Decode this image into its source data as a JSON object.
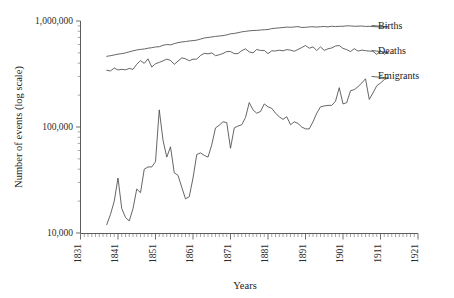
{
  "chart_data": {
    "type": "line",
    "title": "",
    "xlabel": "Years",
    "ylabel": "Number of events (log scale)",
    "yscale": "log",
    "ylim": [
      10000,
      1000000
    ],
    "xlim": [
      1831,
      1921
    ],
    "grid": false,
    "legend_position": "right-inline-labels",
    "ytick_labels": [
      "1,000,000",
      "100,000",
      "10,000"
    ],
    "ytick_values": [
      1000000,
      100000,
      10000
    ],
    "xtick_labels": [
      "1831",
      "1841",
      "1851",
      "1861",
      "1871",
      "1881",
      "1891",
      "1901",
      "1911",
      "1921"
    ],
    "xtick_values": [
      1831,
      1841,
      1851,
      1861,
      1871,
      1881,
      1891,
      1901,
      1911,
      1921
    ],
    "series": [
      {
        "name": "Births",
        "label": "Births",
        "color": "#4a4a4a",
        "x": [
          1838,
          1839,
          1840,
          1841,
          1842,
          1843,
          1844,
          1845,
          1846,
          1847,
          1848,
          1849,
          1850,
          1851,
          1852,
          1853,
          1854,
          1855,
          1856,
          1857,
          1858,
          1859,
          1860,
          1861,
          1862,
          1863,
          1864,
          1865,
          1866,
          1867,
          1868,
          1869,
          1870,
          1871,
          1872,
          1873,
          1874,
          1875,
          1876,
          1877,
          1878,
          1879,
          1880,
          1881,
          1882,
          1883,
          1884,
          1885,
          1886,
          1887,
          1888,
          1889,
          1890,
          1891,
          1892,
          1893,
          1894,
          1895,
          1896,
          1897,
          1898,
          1899,
          1900,
          1901,
          1902,
          1903,
          1904,
          1905,
          1906,
          1907,
          1908,
          1909,
          1910,
          1911,
          1912,
          1913
        ],
        "y": [
          464000,
          471000,
          478000,
          487000,
          492000,
          500000,
          512000,
          523000,
          533000,
          540000,
          544000,
          554000,
          560000,
          569000,
          572000,
          590000,
          600000,
          596000,
          611000,
          625000,
          634000,
          640000,
          648000,
          653000,
          660000,
          675000,
          691000,
          699000,
          707000,
          716000,
          722000,
          728000,
          740000,
          757000,
          763000,
          775000,
          790000,
          798000,
          807000,
          813000,
          815000,
          822000,
          827000,
          831000,
          847000,
          855000,
          861000,
          868000,
          876000,
          872000,
          879000,
          885000,
          869000,
          871000,
          880000,
          882000,
          876000,
          883000,
          888000,
          880000,
          893000,
          886000,
          891000,
          892000,
          900000,
          899000,
          891000,
          894000,
          897000,
          888000,
          891000,
          885000,
          883000,
          872000,
          878000,
          881000
        ]
      },
      {
        "name": "Deaths",
        "label": "Deaths",
        "color": "#4a4a4a",
        "x": [
          1838,
          1839,
          1840,
          1841,
          1842,
          1843,
          1844,
          1845,
          1846,
          1847,
          1848,
          1849,
          1850,
          1851,
          1852,
          1853,
          1854,
          1855,
          1856,
          1857,
          1858,
          1859,
          1860,
          1861,
          1862,
          1863,
          1864,
          1865,
          1866,
          1867,
          1868,
          1869,
          1870,
          1871,
          1872,
          1873,
          1874,
          1875,
          1876,
          1877,
          1878,
          1879,
          1880,
          1881,
          1882,
          1883,
          1884,
          1885,
          1886,
          1887,
          1888,
          1889,
          1890,
          1891,
          1892,
          1893,
          1894,
          1895,
          1896,
          1897,
          1898,
          1899,
          1900,
          1901,
          1902,
          1903,
          1904,
          1905,
          1906,
          1907,
          1908,
          1909,
          1910,
          1911,
          1912,
          1913
        ],
        "y": [
          343000,
          338000,
          360000,
          345000,
          350000,
          346000,
          357000,
          350000,
          391000,
          423000,
          399000,
          440000,
          368000,
          395000,
          407000,
          421000,
          437000,
          425000,
          390000,
          419000,
          449000,
          440000,
          422000,
          436000,
          437000,
          473000,
          495000,
          490000,
          500000,
          471000,
          480000,
          494000,
          515000,
          515000,
          492000,
          493000,
          526000,
          546000,
          511000,
          500000,
          539000,
          527000,
          528000,
          492000,
          523000,
          522000,
          530000,
          523000,
          537000,
          531000,
          518000,
          539000,
          562000,
          587000,
          554000,
          570000,
          527000,
          570000,
          528000,
          547000,
          557000,
          581000,
          587000,
          551000,
          537000,
          514000,
          549000,
          520000,
          531000,
          525000,
          520000,
          518000,
          483000,
          527000,
          486000,
          504000
        ]
      },
      {
        "name": "Emigrants",
        "label": "Emigrants",
        "color": "#4a4a4a",
        "x": [
          1838,
          1839,
          1840,
          1841,
          1842,
          1843,
          1844,
          1845,
          1846,
          1847,
          1848,
          1849,
          1850,
          1851,
          1852,
          1853,
          1854,
          1855,
          1856,
          1857,
          1858,
          1859,
          1860,
          1861,
          1862,
          1863,
          1864,
          1865,
          1866,
          1867,
          1868,
          1869,
          1870,
          1871,
          1872,
          1873,
          1874,
          1875,
          1876,
          1877,
          1878,
          1879,
          1880,
          1881,
          1882,
          1883,
          1884,
          1885,
          1886,
          1887,
          1888,
          1889,
          1890,
          1891,
          1892,
          1893,
          1894,
          1895,
          1896,
          1897,
          1898,
          1899,
          1900,
          1901,
          1902,
          1903,
          1904,
          1905,
          1906,
          1907,
          1908,
          1909,
          1910,
          1911,
          1912,
          1913
        ],
        "y": [
          12000,
          15000,
          20000,
          33000,
          17000,
          14000,
          13000,
          17000,
          26000,
          24000,
          40000,
          42000,
          42000,
          47000,
          145000,
          75000,
          52000,
          65000,
          37000,
          35000,
          27000,
          21000,
          22000,
          33000,
          55000,
          57000,
          54000,
          52000,
          68000,
          98000,
          104000,
          112000,
          110000,
          63000,
          98000,
          102000,
          105000,
          123000,
          170000,
          145000,
          135000,
          140000,
          165000,
          155000,
          150000,
          135000,
          125000,
          118000,
          125000,
          105000,
          112000,
          108000,
          100000,
          96000,
          96000,
          112000,
          135000,
          155000,
          158000,
          160000,
          160000,
          175000,
          235000,
          165000,
          170000,
          220000,
          225000,
          240000,
          260000,
          285000,
          182000,
          210000,
          245000,
          260000,
          280000,
          290000
        ]
      }
    ]
  },
  "axes": {
    "y_title": "Number of events (log scale)",
    "x_title": "Years"
  }
}
